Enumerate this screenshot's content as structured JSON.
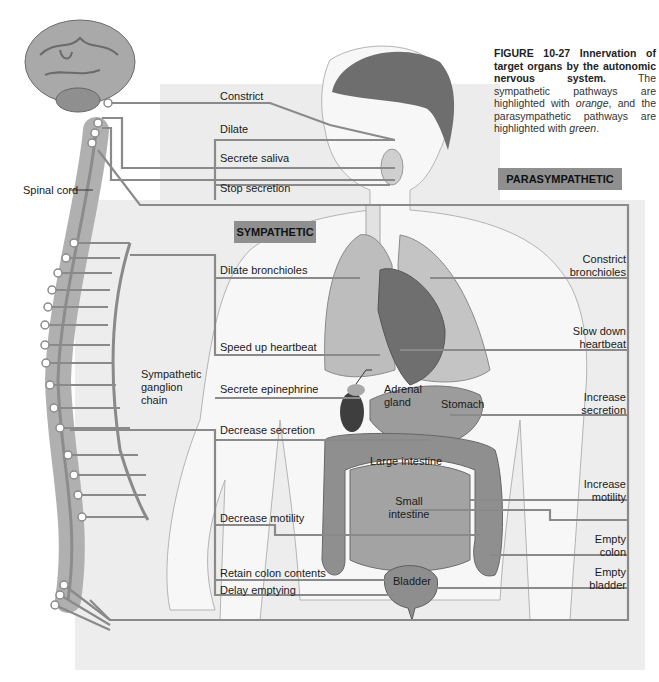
{
  "caption": {
    "figure_number": "FIGURE 10-27",
    "title": "Innervation of target organs by the autonomic nervous system.",
    "body_prefix": "The sympathetic pathways are highlighted with ",
    "orange": "orange",
    "body_middle": ", and the parasympathetic pathways are highlighted with ",
    "green": "green",
    "body_suffix": "."
  },
  "divisions": {
    "sympathetic": "SYMPATHETIC",
    "parasympathetic": "PARASYMPATHETIC"
  },
  "anatomy_labels": {
    "spinal_cord": "Spinal cord",
    "ganglion_chain": "Sympathetic ganglion chain",
    "adrenal_gland": "Adrenal gland",
    "stomach": "Stomach",
    "large_intestine": "Large intestine",
    "small_intestine": "Small intestine",
    "bladder": "Bladder"
  },
  "sympathetic_effects": [
    {
      "organ": "eye",
      "label": "Dilate"
    },
    {
      "organ": "salivary",
      "label": "Stop secretion"
    },
    {
      "organ": "lungs",
      "label": "Dilate bronchioles"
    },
    {
      "organ": "heart",
      "label": "Speed up heartbeat"
    },
    {
      "organ": "adrenal",
      "label": "Secrete epinephrine"
    },
    {
      "organ": "stomach",
      "label": "Decrease secretion"
    },
    {
      "organ": "intestine",
      "label": "Decrease motility"
    },
    {
      "organ": "colon",
      "label": "Retain colon contents"
    },
    {
      "organ": "bladder",
      "label": "Delay emptying"
    }
  ],
  "parasympathetic_effects_left": [
    {
      "organ": "eye",
      "label": "Constrict"
    },
    {
      "organ": "salivary",
      "label": "Secrete saliva"
    }
  ],
  "parasympathetic_effects_right": [
    {
      "organ": "lungs",
      "label": "Constrict bronchioles"
    },
    {
      "organ": "heart",
      "label": "Slow down heartbeat"
    },
    {
      "organ": "stomach",
      "label": "Increase secretion"
    },
    {
      "organ": "intestine",
      "label": "Increase motility"
    },
    {
      "organ": "colon",
      "label": "Empty colon"
    },
    {
      "organ": "bladder",
      "label": "Empty bladder"
    }
  ],
  "colors": {
    "panel": "#ececec",
    "line": "#8a8a8a",
    "badge": "#8f8f8f"
  }
}
